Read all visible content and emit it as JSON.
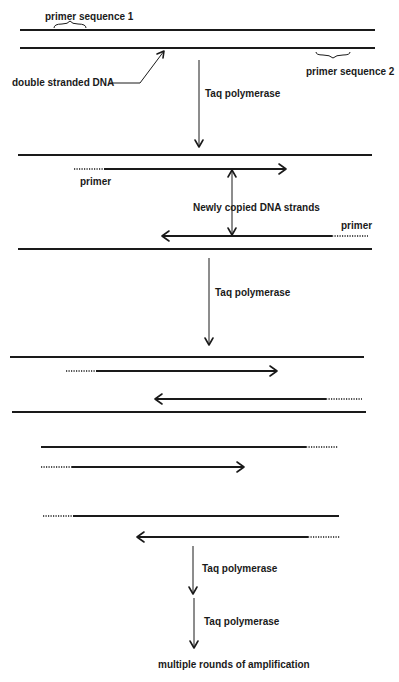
{
  "diagram": {
    "colors": {
      "ink": "#1a1a1a",
      "background": "#ffffff"
    },
    "labels": {
      "primer_sequence_1": "primer sequence 1",
      "primer_sequence_2": "primer sequence 2",
      "double_stranded_dna": "double stranded DNA",
      "taq_1": "Taq polymerase",
      "primer_left": "primer",
      "newly_copied": "Newly copied DNA strands",
      "primer_right": "primer",
      "taq_2": "Taq polymerase",
      "taq_3": "Taq polymerase",
      "taq_4": "Taq polymerase",
      "final": "multiple rounds of amplification"
    },
    "stages": [
      {
        "name": "initial double stranded DNA",
        "strands": 2
      },
      {
        "name": "first copy",
        "strands": 4
      },
      {
        "name": "second round",
        "strands": 4
      },
      {
        "name": "third round",
        "strands": 4
      }
    ]
  }
}
